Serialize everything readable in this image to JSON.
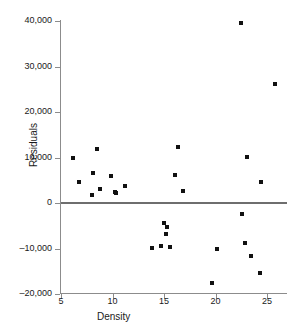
{
  "chart_data": {
    "type": "scatter",
    "title": "",
    "xlabel": "Density",
    "ylabel": "Residuals",
    "xlim": [
      5,
      26.9
    ],
    "ylim": [
      -20000,
      40000
    ],
    "grid": false,
    "legend": "none",
    "annotations": [
      "horizontal reference line at y = 0"
    ],
    "xticks": [
      5,
      10,
      15,
      20,
      25
    ],
    "xtick_labels": [
      "5",
      "10",
      "15",
      "20",
      "25"
    ],
    "yticks": [
      -20000,
      -10000,
      0,
      10000,
      20000,
      30000,
      40000
    ],
    "ytick_labels": [
      "–20,000",
      "–10,000",
      "0",
      "10,000",
      "20,000",
      "30,000",
      "40,000"
    ],
    "series": [
      {
        "name": "residuals",
        "marker": "square",
        "color": "#111111",
        "points": [
          {
            "x": 6.2,
            "y": 9900
          },
          {
            "x": 6.7,
            "y": 4600
          },
          {
            "x": 8.0,
            "y": 1800
          },
          {
            "x": 8.1,
            "y": 6700
          },
          {
            "x": 8.5,
            "y": 11800
          },
          {
            "x": 8.8,
            "y": 3000
          },
          {
            "x": 9.9,
            "y": 5900
          },
          {
            "x": 10.2,
            "y": 2500
          },
          {
            "x": 10.3,
            "y": 2200
          },
          {
            "x": 11.2,
            "y": 3800
          },
          {
            "x": 13.8,
            "y": -9800
          },
          {
            "x": 14.7,
            "y": -9500
          },
          {
            "x": 15.0,
            "y": -4300
          },
          {
            "x": 15.3,
            "y": -5300
          },
          {
            "x": 15.2,
            "y": -6800
          },
          {
            "x": 15.6,
            "y": -9700
          },
          {
            "x": 16.4,
            "y": 12200
          },
          {
            "x": 16.1,
            "y": 6200
          },
          {
            "x": 16.8,
            "y": 2600
          },
          {
            "x": 19.7,
            "y": -17500
          },
          {
            "x": 20.1,
            "y": -10200
          },
          {
            "x": 22.5,
            "y": 39500
          },
          {
            "x": 22.6,
            "y": -2500
          },
          {
            "x": 23.1,
            "y": 10100
          },
          {
            "x": 22.9,
            "y": -8800
          },
          {
            "x": 23.4,
            "y": -11700
          },
          {
            "x": 24.4,
            "y": 4600
          },
          {
            "x": 24.3,
            "y": -15400
          },
          {
            "x": 25.8,
            "y": 26200
          }
        ]
      }
    ]
  }
}
